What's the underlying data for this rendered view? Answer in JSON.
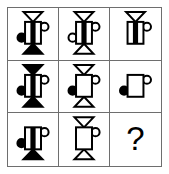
{
  "puzzle": {
    "type": "ravens-progressive-matrix",
    "rows": 3,
    "columns": 3,
    "border_color": "#6e6e6e",
    "ink_color": "#000000",
    "background_color": "#ffffff",
    "missing_cell_label": "?",
    "cells": [
      {
        "id": "cell-1",
        "row": 1,
        "column": 1,
        "name": "matrix-cell-r1c1",
        "top_triangle": "outline",
        "bottom_triangle": "filled",
        "body": "striped",
        "left_circle": "filled",
        "right_circle": "outline"
      },
      {
        "id": "cell-2",
        "row": 1,
        "column": 2,
        "name": "matrix-cell-r1c2",
        "top_triangle": "outline",
        "bottom_triangle": "outline",
        "body": "striped",
        "left_circle": "outline",
        "right_circle": "outline"
      },
      {
        "id": "cell-3",
        "row": 1,
        "column": 3,
        "name": "matrix-cell-r1c3",
        "top_triangle": "outline",
        "bottom_triangle": "none",
        "body": "striped",
        "left_circle": "none",
        "right_circle": "outline"
      },
      {
        "id": "cell-4",
        "row": 2,
        "column": 1,
        "name": "matrix-cell-r2c1",
        "top_triangle": "filled",
        "bottom_triangle": "filled",
        "body": "striped",
        "left_circle": "filled",
        "right_circle": "outline"
      },
      {
        "id": "cell-5",
        "row": 2,
        "column": 2,
        "name": "matrix-cell-r2c2",
        "top_triangle": "outline",
        "bottom_triangle": "outline",
        "body": "plain",
        "left_circle": "filled",
        "right_circle": "outline"
      },
      {
        "id": "cell-6",
        "row": 2,
        "column": 3,
        "name": "matrix-cell-r2c3",
        "top_triangle": "none",
        "bottom_triangle": "none",
        "body": "plain",
        "left_circle": "filled",
        "right_circle": "outline"
      },
      {
        "id": "cell-7",
        "row": 3,
        "column": 1,
        "name": "matrix-cell-r3c1",
        "top_triangle": "none",
        "bottom_triangle": "filled",
        "body": "striped",
        "left_circle": "filled",
        "right_circle": "outline"
      },
      {
        "id": "cell-8",
        "row": 3,
        "column": 2,
        "name": "matrix-cell-r3c2",
        "top_triangle": "outline",
        "bottom_triangle": "outline",
        "body": "plain",
        "left_circle": "none",
        "right_circle": "outline"
      },
      {
        "id": "cell-9",
        "row": 3,
        "column": 3,
        "name": "matrix-cell-r3c3",
        "is_question": true,
        "label": "?"
      }
    ]
  }
}
